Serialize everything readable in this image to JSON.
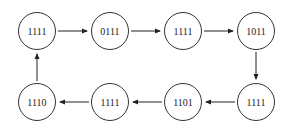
{
  "diagram": {
    "type": "state-cycle",
    "nodes": [
      {
        "id": "n1",
        "label": "1111",
        "cx": 37,
        "cy": 31
      },
      {
        "id": "n2",
        "label": "0111",
        "cx": 110,
        "cy": 31
      },
      {
        "id": "n3",
        "label": "1111",
        "cx": 183,
        "cy": 31
      },
      {
        "id": "n4",
        "label": "1011",
        "cx": 256,
        "cy": 31
      },
      {
        "id": "n5",
        "label": "1111",
        "cx": 256,
        "cy": 102
      },
      {
        "id": "n6",
        "label": "1101",
        "cx": 183,
        "cy": 102
      },
      {
        "id": "n7",
        "label": "1111",
        "cx": 110,
        "cy": 102
      },
      {
        "id": "n8",
        "label": "1110",
        "cx": 37,
        "cy": 102
      }
    ],
    "edges": [
      {
        "from": "n1",
        "to": "n2"
      },
      {
        "from": "n2",
        "to": "n3"
      },
      {
        "from": "n3",
        "to": "n4"
      },
      {
        "from": "n4",
        "to": "n5"
      },
      {
        "from": "n5",
        "to": "n6"
      },
      {
        "from": "n6",
        "to": "n7"
      },
      {
        "from": "n7",
        "to": "n8"
      },
      {
        "from": "n8",
        "to": "n1"
      }
    ]
  }
}
